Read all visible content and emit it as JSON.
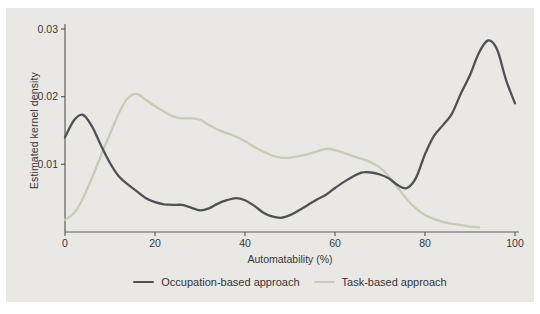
{
  "colors": {
    "panel_background": "#e9e8e4",
    "axis": "#5d5e61",
    "tick_text": "#38383b",
    "occupation_line": "#505156",
    "task_line": "#c6ccb9"
  },
  "legend": {
    "items": [
      {
        "key": "occupation-based",
        "label": "Occupation-based approach",
        "color": "#505156"
      },
      {
        "key": "task-based",
        "label": "Task-based approach",
        "color": "#c6ccb9"
      }
    ]
  },
  "chart_data": {
    "type": "line",
    "title": "",
    "xlabel": "Automatability (%)",
    "ylabel": "Estimated kernel density",
    "xlim": [
      0,
      100
    ],
    "ylim": [
      0,
      0.03
    ],
    "grid": false,
    "legend_position": "bottom",
    "x_ticks": [
      0,
      20,
      40,
      60,
      80,
      100
    ],
    "x_tick_labels": [
      "0",
      "20",
      "40",
      "60",
      "80",
      "100"
    ],
    "y_ticks": [
      0.01,
      0.02,
      0.03
    ],
    "y_tick_labels": [
      "0.01",
      "0.02",
      "0.03"
    ],
    "series": [
      {
        "key": "occupation-based",
        "name": "Occupation-based approach",
        "color": "#505156",
        "x": [
          0,
          2,
          4,
          6,
          8,
          10,
          12,
          14,
          16,
          18,
          20,
          22,
          24,
          26,
          28,
          30,
          32,
          34,
          36,
          38,
          40,
          42,
          44,
          46,
          48,
          50,
          52,
          54,
          56,
          58,
          60,
          62,
          64,
          66,
          68,
          70,
          72,
          74,
          76,
          78,
          80,
          82,
          84,
          86,
          88,
          90,
          92,
          94,
          96,
          98,
          100
        ],
        "y": [
          0.014,
          0.0165,
          0.0173,
          0.0156,
          0.0128,
          0.0102,
          0.0082,
          0.007,
          0.006,
          0.005,
          0.0044,
          0.0041,
          0.004,
          0.004,
          0.0036,
          0.0032,
          0.0035,
          0.0042,
          0.0047,
          0.005,
          0.0047,
          0.0039,
          0.0029,
          0.0023,
          0.0021,
          0.0025,
          0.0032,
          0.004,
          0.0048,
          0.0055,
          0.0065,
          0.0074,
          0.0082,
          0.0088,
          0.0088,
          0.0085,
          0.0079,
          0.0069,
          0.0065,
          0.008,
          0.0115,
          0.0142,
          0.0158,
          0.0175,
          0.0205,
          0.0232,
          0.0265,
          0.0283,
          0.027,
          0.0225,
          0.019
        ]
      },
      {
        "key": "task-based",
        "name": "Task-based approach",
        "color": "#c6ccb9",
        "x": [
          0,
          2,
          4,
          6,
          8,
          10,
          12,
          14,
          16,
          18,
          20,
          22,
          24,
          26,
          28,
          30,
          32,
          34,
          36,
          38,
          40,
          42,
          44,
          46,
          48,
          50,
          52,
          54,
          56,
          58,
          60,
          62,
          64,
          66,
          68,
          70,
          72,
          74,
          76,
          78,
          80,
          82,
          84,
          86,
          88,
          90,
          92
        ],
        "y": [
          0.0018,
          0.0028,
          0.005,
          0.008,
          0.0113,
          0.0145,
          0.0176,
          0.0198,
          0.0204,
          0.0195,
          0.0186,
          0.0178,
          0.0171,
          0.0168,
          0.0168,
          0.0166,
          0.0158,
          0.0151,
          0.0146,
          0.0141,
          0.0134,
          0.0126,
          0.0119,
          0.0113,
          0.011,
          0.011,
          0.0112,
          0.0115,
          0.0119,
          0.0123,
          0.0121,
          0.0117,
          0.0112,
          0.0108,
          0.0103,
          0.0095,
          0.0082,
          0.0065,
          0.0048,
          0.0035,
          0.0025,
          0.0019,
          0.0015,
          0.0012,
          0.001,
          0.0008,
          0.0007
        ]
      }
    ]
  }
}
